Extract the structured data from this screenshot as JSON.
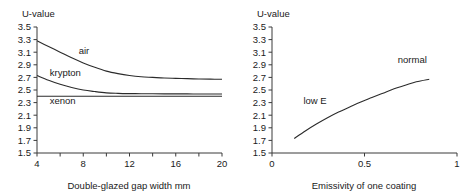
{
  "figure": {
    "panels": [
      {
        "id": "gap-width",
        "y_axis_title": "U-value",
        "x_axis_title": "Double-glazed gap width mm",
        "chart_data": {
          "type": "line",
          "title": "",
          "xlabel": "Double-glazed gap width mm",
          "ylabel": "U-value",
          "xlim": [
            4,
            20
          ],
          "ylim": [
            1.5,
            3.5
          ],
          "xticks": [
            4,
            6,
            8,
            10,
            12,
            14,
            16,
            18,
            20
          ],
          "xticklabels": [
            "4",
            "",
            "8",
            "",
            "12",
            "",
            "16",
            "",
            "20"
          ],
          "yticks": [
            1.5,
            1.7,
            1.9,
            2.1,
            2.3,
            2.5,
            2.7,
            2.9,
            3.1,
            3.3,
            3.5
          ],
          "yticklabels": [
            "1.5",
            "1.7",
            "1.9",
            "2.1",
            "2.3",
            "2.5",
            "2.7",
            "2.9",
            "3.1",
            "3.3",
            "3.5"
          ],
          "grid": false,
          "legend": "inline-labels",
          "series": [
            {
              "name": "air",
              "label": "air",
              "label_x": 7.6,
              "label_y": 3.07,
              "x": [
                4,
                5,
                6,
                7,
                8,
                9,
                10,
                11,
                12,
                13,
                14,
                15,
                16,
                17,
                18,
                19,
                20
              ],
              "y": [
                3.28,
                3.19,
                3.1,
                3.01,
                2.93,
                2.86,
                2.8,
                2.76,
                2.73,
                2.71,
                2.7,
                2.69,
                2.685,
                2.68,
                2.675,
                2.672,
                2.67
              ]
            },
            {
              "name": "krypton",
              "label": "krypton",
              "label_x": 5.1,
              "label_y": 2.72,
              "x": [
                4,
                5,
                6,
                7,
                8,
                9,
                10,
                11,
                12,
                13,
                14,
                15,
                16,
                17,
                18,
                19,
                20
              ],
              "y": [
                2.73,
                2.655,
                2.59,
                2.54,
                2.5,
                2.475,
                2.455,
                2.447,
                2.443,
                2.441,
                2.44,
                2.439,
                2.438,
                2.438,
                2.437,
                2.437,
                2.436
              ]
            },
            {
              "name": "xenon",
              "label": "xenon",
              "label_x": 5.1,
              "label_y": 2.28,
              "x": [
                4,
                20
              ],
              "y": [
                2.4,
                2.4
              ]
            }
          ]
        }
      },
      {
        "id": "emissivity",
        "y_axis_title": "U-value",
        "x_axis_title": "Emissivity of one coating",
        "chart_data": {
          "type": "line",
          "title": "",
          "xlabel": "Emissivity of one coating",
          "ylabel": "U-value",
          "xlim": [
            0,
            1
          ],
          "ylim": [
            1.5,
            3.5
          ],
          "xticks": [
            0,
            0.5,
            1
          ],
          "xticklabels": [
            "0",
            "0.5",
            "1"
          ],
          "yticks": [
            1.5,
            1.7,
            1.9,
            2.1,
            2.3,
            2.5,
            2.7,
            2.9,
            3.1,
            3.3,
            3.5
          ],
          "yticklabels": [
            "1.5",
            "1.7",
            "1.9",
            "2.1",
            "2.3",
            "2.5",
            "2.7",
            "2.9",
            "3.1",
            "3.3",
            "3.5"
          ],
          "grid": false,
          "legend": "inline-labels",
          "annotations": [
            {
              "text": "low E",
              "x": 0.17,
              "y": 2.27
            },
            {
              "text": "normal",
              "x": 0.68,
              "y": 2.93
            }
          ],
          "series": [
            {
              "name": "u-value-vs-emissivity",
              "label": "",
              "x": [
                0.12,
                0.18,
                0.24,
                0.3,
                0.36,
                0.42,
                0.48,
                0.54,
                0.6,
                0.66,
                0.72,
                0.78,
                0.85
              ],
              "y": [
                1.73,
                1.85,
                1.96,
                2.06,
                2.15,
                2.23,
                2.31,
                2.38,
                2.45,
                2.52,
                2.575,
                2.63,
                2.67
              ]
            }
          ]
        }
      }
    ]
  },
  "colors": {
    "curve": "#2b2b2b",
    "axis": "#3a3a3a",
    "text": "#1a1a1a",
    "background": "#ffffff"
  }
}
